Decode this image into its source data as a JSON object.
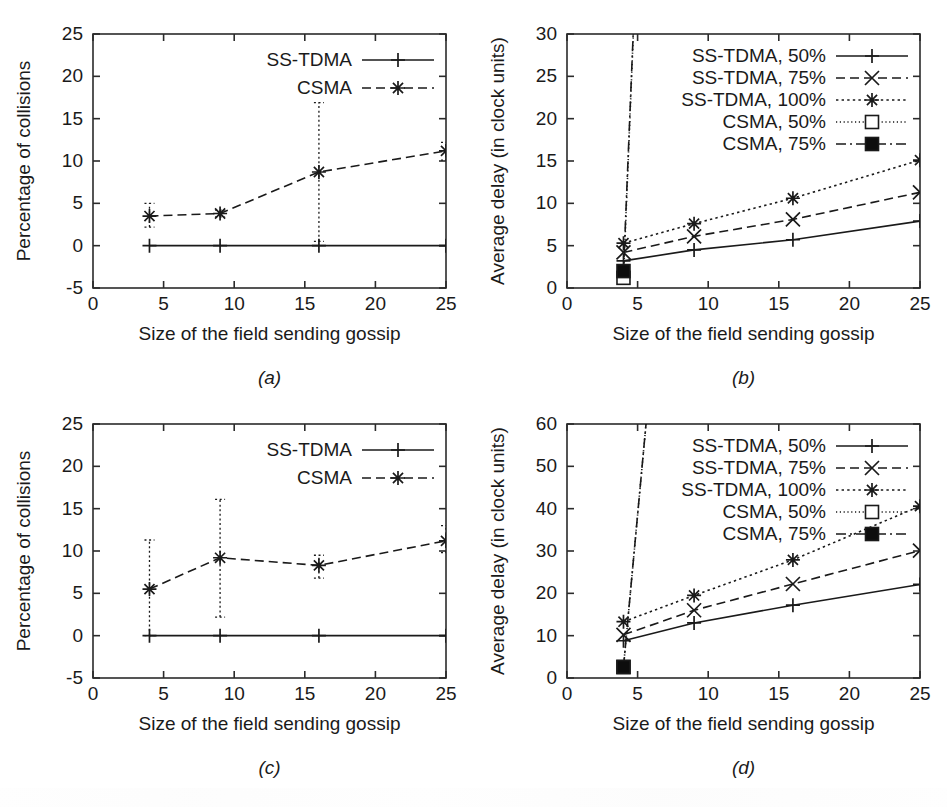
{
  "figure": {
    "width": 947,
    "height": 807,
    "background": "#ffffff",
    "ink": "#1a1a1a",
    "panel_labels": [
      "(a)",
      "(b)",
      "(c)",
      "(d)"
    ]
  },
  "chart_data": [
    {
      "id": "a",
      "panel_label": "(a)",
      "type": "line",
      "title": "",
      "xlabel": "Size of the field sending gossip",
      "ylabel": "Percentage of collisions",
      "xlim": [
        0,
        25
      ],
      "ylim": [
        -5,
        25
      ],
      "xticks": [
        0,
        5,
        10,
        15,
        20,
        25
      ],
      "yticks": [
        -5,
        0,
        5,
        10,
        15,
        20,
        25
      ],
      "xtick_labels": [
        "0",
        "5",
        "10",
        "15",
        "20",
        "25"
      ],
      "ytick_labels": [
        "-5",
        "0",
        "5",
        "10",
        "15",
        "20",
        "25"
      ],
      "grid": false,
      "legend_position": "top-right",
      "x": [
        4,
        9,
        16,
        25
      ],
      "series": [
        {
          "name": "SS-TDMA",
          "style": "solid",
          "marker": "plus",
          "values": [
            0,
            0,
            0,
            0
          ],
          "err_low": [
            0,
            0,
            0,
            0
          ],
          "err_high": [
            0,
            0,
            0,
            0
          ]
        },
        {
          "name": "CSMA",
          "style": "dashed",
          "marker": "star",
          "values": [
            3.5,
            3.8,
            8.7,
            11.2
          ],
          "err_low": [
            2.2,
            3.4,
            0.5,
            10.1
          ],
          "err_high": [
            5.0,
            4.2,
            16.9,
            12.2
          ]
        }
      ]
    },
    {
      "id": "b",
      "panel_label": "(b)",
      "type": "line",
      "title": "",
      "xlabel": "Size of the field sending gossip",
      "ylabel": "Average delay (in clock units)",
      "xlim": [
        0,
        25
      ],
      "ylim": [
        0,
        30
      ],
      "xticks": [
        0,
        5,
        10,
        15,
        20,
        25
      ],
      "yticks": [
        0,
        5,
        10,
        15,
        20,
        25,
        30
      ],
      "xtick_labels": [
        "0",
        "5",
        "10",
        "15",
        "20",
        "25"
      ],
      "ytick_labels": [
        "0",
        "5",
        "10",
        "15",
        "20",
        "25",
        "30"
      ],
      "grid": false,
      "legend_position": "top-right",
      "x": [
        4,
        9,
        16,
        25
      ],
      "series": [
        {
          "name": "SS-TDMA, 50%",
          "style": "solid",
          "marker": "plus",
          "values": [
            3.2,
            4.5,
            5.7,
            7.9
          ]
        },
        {
          "name": "SS-TDMA, 75%",
          "style": "dashed",
          "marker": "cross",
          "values": [
            4.2,
            6.1,
            8.1,
            11.3
          ]
        },
        {
          "name": "SS-TDMA, 100%",
          "style": "dotted",
          "marker": "star",
          "values": [
            5.3,
            7.6,
            10.6,
            15.1
          ]
        },
        {
          "name": "CSMA, 50%",
          "style": "fine-dot",
          "marker": "sq-open",
          "values": [
            1.2
          ]
        },
        {
          "name": "CSMA, 75%",
          "style": "dash-dot",
          "marker": "sq-filled",
          "values": [
            2.0
          ]
        }
      ]
    },
    {
      "id": "c",
      "panel_label": "(c)",
      "type": "line",
      "title": "",
      "xlabel": "Size of the field sending gossip",
      "ylabel": "Percentage of collisions",
      "xlim": [
        0,
        25
      ],
      "ylim": [
        -5,
        25
      ],
      "xticks": [
        0,
        5,
        10,
        15,
        20,
        25
      ],
      "yticks": [
        -5,
        0,
        5,
        10,
        15,
        20,
        25
      ],
      "xtick_labels": [
        "0",
        "5",
        "10",
        "15",
        "20",
        "25"
      ],
      "ytick_labels": [
        "-5",
        "0",
        "5",
        "10",
        "15",
        "20",
        "25"
      ],
      "grid": false,
      "legend_position": "top-right",
      "x": [
        4,
        9,
        16,
        25
      ],
      "series": [
        {
          "name": "SS-TDMA",
          "style": "solid",
          "marker": "plus",
          "values": [
            0,
            0,
            0,
            0
          ],
          "err_low": [
            0,
            0,
            0,
            0
          ],
          "err_high": [
            0,
            0,
            0,
            0
          ]
        },
        {
          "name": "CSMA",
          "style": "dashed",
          "marker": "star",
          "values": [
            5.5,
            9.2,
            8.3,
            11.2
          ],
          "err_low": [
            0.0,
            2.2,
            6.8,
            9.8
          ],
          "err_high": [
            11.3,
            16.1,
            9.5,
            13.0
          ]
        }
      ]
    },
    {
      "id": "d",
      "panel_label": "(d)",
      "type": "line",
      "title": "",
      "xlabel": "Size of the field sending gossip",
      "ylabel": "Average delay (in clock units)",
      "xlim": [
        0,
        25
      ],
      "ylim": [
        0,
        60
      ],
      "xticks": [
        0,
        5,
        10,
        15,
        20,
        25
      ],
      "yticks": [
        0,
        10,
        20,
        30,
        40,
        50,
        60
      ],
      "xtick_labels": [
        "0",
        "5",
        "10",
        "15",
        "20",
        "25"
      ],
      "ytick_labels": [
        "0",
        "10",
        "20",
        "30",
        "40",
        "50",
        "60"
      ],
      "grid": false,
      "legend_position": "top-right",
      "x": [
        4,
        9,
        16,
        25
      ],
      "series": [
        {
          "name": "SS-TDMA, 50%",
          "style": "solid",
          "marker": "plus",
          "values": [
            8.8,
            13.0,
            17.2,
            22.1
          ]
        },
        {
          "name": "SS-TDMA, 75%",
          "style": "dashed",
          "marker": "cross",
          "values": [
            10.2,
            16.0,
            22.2,
            30.1
          ]
        },
        {
          "name": "SS-TDMA, 100%",
          "style": "dotted",
          "marker": "star",
          "values": [
            13.3,
            19.5,
            27.9,
            40.6
          ]
        },
        {
          "name": "CSMA, 50%",
          "style": "fine-dot",
          "marker": "sq-open",
          "values": [
            2.6
          ]
        },
        {
          "name": "CSMA, 75%",
          "style": "dash-dot",
          "marker": "sq-filled",
          "values": [
            2.6
          ]
        }
      ]
    }
  ]
}
